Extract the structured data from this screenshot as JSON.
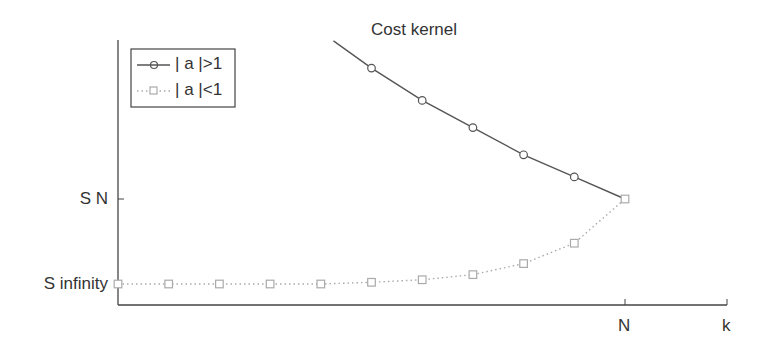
{
  "chart_data": {
    "type": "line",
    "title": "Cost kernel",
    "xlabel": "k",
    "ylabel": "",
    "x_ticks": [
      {
        "label": "N",
        "k_offset": 0
      }
    ],
    "y_ticks": [
      {
        "label": "S N",
        "value": 1.0
      },
      {
        "label": "S infinity",
        "value": 0.0
      }
    ],
    "x_axis_note": "k expressed as offset from N (k - N)",
    "y_axis_note": "normalized so S infinity = 0 and S N = 1",
    "xlim": [
      -10,
      2
    ],
    "ylim": [
      -0.25,
      2.9
    ],
    "grid": false,
    "legend_position": "upper left",
    "series": [
      {
        "name": "| a |>1",
        "line_style": "solid",
        "marker": "circle",
        "color": "#555555",
        "line_start": {
          "x": -5.75,
          "y": 2.86
        },
        "x": [
          -5,
          -4,
          -3,
          -2,
          -1,
          0
        ],
        "y": [
          2.54,
          2.16,
          1.84,
          1.52,
          1.26,
          1.0
        ]
      },
      {
        "name": "| a |<1",
        "line_style": "dotted",
        "marker": "square",
        "color": "#aaaaaa",
        "x": [
          -10,
          -9,
          -8,
          -7,
          -6,
          -5,
          -4,
          -3,
          -2,
          -1,
          0
        ],
        "y": [
          0.0,
          0.0,
          0.0,
          0.0,
          0.0,
          0.02,
          0.05,
          0.11,
          0.24,
          0.48,
          1.0
        ]
      }
    ]
  },
  "legend": {
    "items": [
      {
        "label": "| a |>1"
      },
      {
        "label": "| a |<1"
      }
    ]
  }
}
